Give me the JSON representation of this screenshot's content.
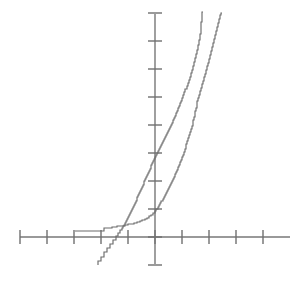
{
  "chart_data": {
    "type": "line",
    "title": "",
    "subtitle": "",
    "xlabel": "",
    "ylabel": "",
    "grid": false,
    "legend": "none",
    "axis_style": "crossed-axes-with-unlabeled-ticks",
    "xlim": [
      -5.2,
      5.0
    ],
    "ylim": [
      -1.0,
      8.2
    ],
    "x_tick_values": [
      -5,
      -4,
      -3,
      -2,
      -1,
      0,
      1,
      2,
      3,
      4
    ],
    "y_tick_values": [
      -1,
      0,
      1,
      2,
      3,
      4,
      5,
      6,
      7,
      8
    ],
    "x_tick_labels": [
      "",
      "",
      "",
      "",
      "",
      "",
      "",
      "",
      "",
      ""
    ],
    "y_tick_labels": [
      "",
      "",
      "",
      "",
      "",
      "",
      "",
      "",
      "",
      ""
    ],
    "origin_px": {
      "x": 155,
      "y": 237
    },
    "x_axis_span_px": {
      "start": 20,
      "end": 290
    },
    "y_axis_span_px": {
      "start": 14,
      "end": 264
    },
    "x_tick_spacing_px": 27,
    "y_tick_spacing_px": 28,
    "annotations": [],
    "series": [
      {
        "name": "series-1",
        "description": "left stepped empirical curve, steeper, crosses x-axis left of origin",
        "color": "#6b6b6b",
        "style": "step",
        "points": [
          [
            98,
            265
          ],
          [
            101,
            261
          ],
          [
            104,
            257
          ],
          [
            107,
            252
          ],
          [
            110,
            248
          ],
          [
            113,
            244
          ],
          [
            116,
            240
          ],
          [
            118,
            236
          ],
          [
            120,
            233
          ],
          [
            122,
            230
          ],
          [
            123,
            228
          ],
          [
            125,
            226
          ],
          [
            126,
            223
          ],
          [
            127,
            221
          ],
          [
            128,
            219
          ],
          [
            129,
            217
          ],
          [
            130,
            215
          ],
          [
            131,
            213
          ],
          [
            132,
            211
          ],
          [
            133,
            209
          ],
          [
            134,
            207
          ],
          [
            135,
            205
          ],
          [
            136,
            203
          ],
          [
            137,
            201
          ],
          [
            137,
            199
          ],
          [
            138,
            197
          ],
          [
            139,
            195
          ],
          [
            140,
            193
          ],
          [
            141,
            191
          ],
          [
            142,
            189
          ],
          [
            143,
            187
          ],
          [
            144,
            185
          ],
          [
            144,
            183
          ],
          [
            145,
            181
          ],
          [
            146,
            179
          ],
          [
            147,
            177
          ],
          [
            148,
            175
          ],
          [
            149,
            173
          ],
          [
            150,
            171
          ],
          [
            151,
            169
          ],
          [
            151,
            167
          ],
          [
            152,
            165
          ],
          [
            153,
            163
          ],
          [
            154,
            161
          ],
          [
            155,
            159
          ],
          [
            156,
            157
          ],
          [
            157,
            155
          ],
          [
            158,
            153
          ],
          [
            159,
            151
          ],
          [
            160,
            149
          ],
          [
            161,
            147
          ],
          [
            162,
            145
          ],
          [
            163,
            143
          ],
          [
            164,
            141
          ],
          [
            165,
            139
          ],
          [
            166,
            137
          ],
          [
            167,
            135
          ],
          [
            168,
            133
          ],
          [
            169,
            131
          ],
          [
            170,
            129
          ],
          [
            171,
            127
          ],
          [
            172,
            125
          ],
          [
            173,
            123
          ],
          [
            174,
            120
          ],
          [
            175,
            118
          ],
          [
            176,
            116
          ],
          [
            177,
            113
          ],
          [
            178,
            111
          ],
          [
            179,
            108
          ],
          [
            180,
            106
          ],
          [
            181,
            103
          ],
          [
            182,
            101
          ],
          [
            183,
            98
          ],
          [
            184,
            95
          ],
          [
            185,
            92
          ],
          [
            187,
            89
          ],
          [
            188,
            86
          ],
          [
            189,
            83
          ],
          [
            190,
            80
          ],
          [
            191,
            77
          ],
          [
            192,
            73
          ],
          [
            193,
            70
          ],
          [
            194,
            66
          ],
          [
            195,
            62
          ],
          [
            196,
            58
          ],
          [
            197,
            54
          ],
          [
            198,
            50
          ],
          [
            199,
            45
          ],
          [
            200,
            40
          ],
          [
            201,
            34
          ],
          [
            201,
            28
          ],
          [
            202,
            22
          ],
          [
            202,
            16
          ],
          [
            203,
            12
          ]
        ]
      },
      {
        "name": "series-2",
        "description": "right stepped empirical curve with long flat tail at left, crosses series-1 near top",
        "color": "#6b6b6b",
        "style": "step",
        "points": [
          [
            75,
            231
          ],
          [
            88,
            231
          ],
          [
            95,
            231
          ],
          [
            104,
            231
          ],
          [
            105,
            228
          ],
          [
            112,
            228
          ],
          [
            117,
            227
          ],
          [
            120,
            226
          ],
          [
            124,
            226
          ],
          [
            128,
            225
          ],
          [
            131,
            224
          ],
          [
            134,
            224
          ],
          [
            137,
            223
          ],
          [
            140,
            222
          ],
          [
            142,
            221
          ],
          [
            145,
            220
          ],
          [
            147,
            219
          ],
          [
            149,
            218
          ],
          [
            151,
            216
          ],
          [
            153,
            215
          ],
          [
            155,
            213
          ],
          [
            156,
            211
          ],
          [
            158,
            209
          ],
          [
            159,
            207
          ],
          [
            160,
            205
          ],
          [
            161,
            203
          ],
          [
            163,
            201
          ],
          [
            164,
            199
          ],
          [
            165,
            197
          ],
          [
            166,
            195
          ],
          [
            167,
            193
          ],
          [
            168,
            191
          ],
          [
            169,
            189
          ],
          [
            170,
            187
          ],
          [
            171,
            185
          ],
          [
            172,
            183
          ],
          [
            173,
            181
          ],
          [
            174,
            179
          ],
          [
            175,
            177
          ],
          [
            176,
            174
          ],
          [
            177,
            172
          ],
          [
            178,
            170
          ],
          [
            179,
            167
          ],
          [
            180,
            165
          ],
          [
            181,
            162
          ],
          [
            182,
            160
          ],
          [
            183,
            157
          ],
          [
            184,
            155
          ],
          [
            185,
            152
          ],
          [
            186,
            149
          ],
          [
            186,
            147
          ],
          [
            187,
            144
          ],
          [
            188,
            141
          ],
          [
            189,
            138
          ],
          [
            190,
            135
          ],
          [
            191,
            132
          ],
          [
            192,
            129
          ],
          [
            193,
            126
          ],
          [
            193,
            123
          ],
          [
            194,
            120
          ],
          [
            195,
            117
          ],
          [
            195,
            114
          ],
          [
            196,
            111
          ],
          [
            197,
            108
          ],
          [
            197,
            105
          ],
          [
            198,
            101
          ],
          [
            199,
            98
          ],
          [
            200,
            95
          ],
          [
            201,
            91
          ],
          [
            202,
            88
          ],
          [
            203,
            84
          ],
          [
            204,
            81
          ],
          [
            205,
            77
          ],
          [
            206,
            74
          ],
          [
            207,
            70
          ],
          [
            208,
            66
          ],
          [
            209,
            63
          ],
          [
            210,
            59
          ],
          [
            211,
            55
          ],
          [
            212,
            51
          ],
          [
            213,
            47
          ],
          [
            214,
            43
          ],
          [
            215,
            39
          ],
          [
            216,
            35
          ],
          [
            217,
            31
          ],
          [
            218,
            27
          ],
          [
            219,
            23
          ],
          [
            220,
            19
          ],
          [
            221,
            15
          ],
          [
            222,
            13
          ]
        ]
      }
    ]
  }
}
